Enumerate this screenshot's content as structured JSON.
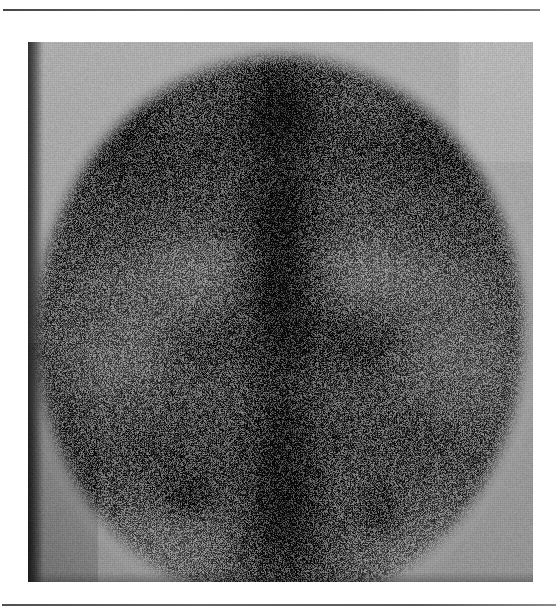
{
  "page": {
    "background_color": "#ffffff",
    "width": 559,
    "height": 614,
    "rule_color": "#3f3f3f",
    "top_rule_label": "",
    "bottom_rule_label": ""
  },
  "figure": {
    "caption": "",
    "plate_background_color": "#a6a6a6",
    "plate_left": 28,
    "plate_top": 42,
    "plate_width": 505,
    "plate_height": 540,
    "modality_label": "",
    "corner_tone_top_left": "#a3a3a3",
    "corner_tone_top_right": "#b2b2b2",
    "corner_tone_bottom_left": "#8d8d8d",
    "corner_tone_bottom_right": "#a9a9a9",
    "field_of_view_shape": "circle",
    "field_of_view_color": "#2a2a2a"
  },
  "chart_data": {
    "type": "heatmap",
    "title": "",
    "subtitle": "",
    "xlabel": "",
    "ylabel": "",
    "legend": [],
    "grid": false,
    "colormap": "grayscale-inverted",
    "value_range": [
      0,
      255
    ],
    "field_of_view": {
      "center_x": 252,
      "center_y": 290,
      "radius_x": 232,
      "radius_y": 262
    },
    "background_level": 172,
    "noise_amplitude": 58,
    "structures": [
      {
        "name": "spine-column",
        "cx": 252,
        "cy": 270,
        "rx": 44,
        "ry": 250,
        "intensity": 232,
        "softness": 0.55
      },
      {
        "name": "upper-thoracic-spine",
        "cx": 250,
        "cy": 60,
        "rx": 52,
        "ry": 70,
        "intensity": 238,
        "softness": 0.5
      },
      {
        "name": "mid-thoracic-spine",
        "cx": 252,
        "cy": 200,
        "rx": 38,
        "ry": 95,
        "intensity": 226,
        "softness": 0.55
      },
      {
        "name": "lumbar-spine",
        "cx": 255,
        "cy": 380,
        "rx": 42,
        "ry": 110,
        "intensity": 222,
        "softness": 0.58
      },
      {
        "name": "sacrum",
        "cx": 258,
        "cy": 490,
        "rx": 56,
        "ry": 72,
        "intensity": 236,
        "softness": 0.52
      },
      {
        "name": "rib-band-left-1",
        "cx": 150,
        "cy": 120,
        "rx": 120,
        "ry": 34,
        "intensity": 214,
        "softness": 0.62,
        "rotate": -26
      },
      {
        "name": "rib-band-left-2",
        "cx": 128,
        "cy": 190,
        "rx": 118,
        "ry": 30,
        "intensity": 206,
        "softness": 0.64,
        "rotate": -14
      },
      {
        "name": "rib-band-left-3",
        "cx": 124,
        "cy": 262,
        "rx": 116,
        "ry": 30,
        "intensity": 198,
        "softness": 0.66,
        "rotate": -6
      },
      {
        "name": "rib-band-right-1",
        "cx": 364,
        "cy": 118,
        "rx": 118,
        "ry": 32,
        "intensity": 212,
        "softness": 0.62,
        "rotate": 24
      },
      {
        "name": "rib-band-right-2",
        "cx": 382,
        "cy": 192,
        "rx": 116,
        "ry": 30,
        "intensity": 204,
        "softness": 0.64,
        "rotate": 12
      },
      {
        "name": "rib-band-right-3",
        "cx": 388,
        "cy": 268,
        "rx": 112,
        "ry": 30,
        "intensity": 196,
        "softness": 0.66,
        "rotate": 5
      },
      {
        "name": "left-costal-margin",
        "cx": 96,
        "cy": 92,
        "rx": 92,
        "ry": 40,
        "intensity": 230,
        "softness": 0.5,
        "rotate": -40
      },
      {
        "name": "right-costal-margin",
        "cx": 418,
        "cy": 96,
        "rx": 90,
        "ry": 40,
        "intensity": 226,
        "softness": 0.5,
        "rotate": 40
      },
      {
        "name": "left-iliac-crest",
        "cx": 120,
        "cy": 400,
        "rx": 86,
        "ry": 58,
        "intensity": 208,
        "softness": 0.62,
        "rotate": -22
      },
      {
        "name": "right-iliac-crest",
        "cx": 392,
        "cy": 398,
        "rx": 86,
        "ry": 58,
        "intensity": 204,
        "softness": 0.62,
        "rotate": 22
      },
      {
        "name": "focal-hotspot-lower-left",
        "cx": 160,
        "cy": 452,
        "rx": 46,
        "ry": 36,
        "intensity": 250,
        "softness": 0.4
      },
      {
        "name": "focal-hotspot-lower-right",
        "cx": 352,
        "cy": 470,
        "rx": 38,
        "ry": 40,
        "intensity": 240,
        "softness": 0.45
      },
      {
        "name": "focal-hotspot-upper-right",
        "cx": 330,
        "cy": 300,
        "rx": 58,
        "ry": 40,
        "intensity": 238,
        "softness": 0.48
      },
      {
        "name": "focal-hotspot-upper-left",
        "cx": 176,
        "cy": 300,
        "rx": 50,
        "ry": 36,
        "intensity": 228,
        "softness": 0.5
      },
      {
        "name": "cold-region-left-flank",
        "cx": 92,
        "cy": 300,
        "rx": 64,
        "ry": 92,
        "intensity": 120,
        "softness": 0.7
      },
      {
        "name": "cold-region-right-flank",
        "cx": 424,
        "cy": 306,
        "rx": 62,
        "ry": 94,
        "intensity": 118,
        "softness": 0.7
      },
      {
        "name": "cold-region-left-kidney",
        "cx": 170,
        "cy": 236,
        "rx": 58,
        "ry": 56,
        "intensity": 108,
        "softness": 0.72
      },
      {
        "name": "cold-region-right-kidney",
        "cx": 340,
        "cy": 228,
        "rx": 56,
        "ry": 54,
        "intensity": 104,
        "softness": 0.72
      },
      {
        "name": "cold-region-lower-left",
        "cx": 132,
        "cy": 508,
        "rx": 70,
        "ry": 52,
        "intensity": 112,
        "softness": 0.72
      },
      {
        "name": "cold-region-lower-right",
        "cx": 386,
        "cy": 506,
        "rx": 72,
        "ry": 54,
        "intensity": 116,
        "softness": 0.72
      },
      {
        "name": "cold-region-mid-upper",
        "cx": 252,
        "cy": 350,
        "rx": 46,
        "ry": 34,
        "intensity": 126,
        "softness": 0.74
      }
    ]
  }
}
